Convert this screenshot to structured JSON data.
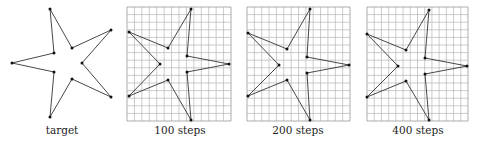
{
  "figure": {
    "panels": [
      {
        "label": "target",
        "has_grid": false,
        "caption_center_x": 62,
        "points": [
          [
            50,
            9
          ],
          [
            54,
            53
          ],
          [
            12,
            63
          ],
          [
            54,
            72
          ],
          [
            50,
            117
          ],
          [
            72,
            79
          ],
          [
            111,
            97
          ],
          [
            82,
            63
          ],
          [
            111,
            30
          ],
          [
            72,
            48
          ]
        ]
      },
      {
        "label": "100 steps",
        "has_grid": true,
        "grid": {
          "x0": 127,
          "y0": 7,
          "x1": 231,
          "y1": 121,
          "cols": 14,
          "rows": 15
        },
        "caption_center_x": 180,
        "points": [
          [
            191,
            9
          ],
          [
            187,
            56
          ],
          [
            229,
            64
          ],
          [
            187,
            72
          ],
          [
            191,
            120
          ],
          [
            168,
            80
          ],
          [
            129,
            96
          ],
          [
            160,
            64
          ],
          [
            129,
            32
          ],
          [
            168,
            48
          ]
        ]
      },
      {
        "label": "200 steps",
        "has_grid": true,
        "grid": {
          "x0": 247,
          "y0": 7,
          "x1": 350,
          "y1": 121,
          "cols": 14,
          "rows": 15
        },
        "caption_center_x": 298,
        "points": [
          [
            310,
            9
          ],
          [
            307,
            57
          ],
          [
            349,
            65
          ],
          [
            307,
            73
          ],
          [
            310,
            120
          ],
          [
            287,
            80
          ],
          [
            248,
            96
          ],
          [
            279,
            65
          ],
          [
            248,
            33
          ],
          [
            287,
            49
          ]
        ]
      },
      {
        "label": "400 steps",
        "has_grid": true,
        "grid": {
          "x0": 367,
          "y0": 7,
          "x1": 468,
          "y1": 121,
          "cols": 14,
          "rows": 15
        },
        "caption_center_x": 418,
        "points": [
          [
            429,
            10
          ],
          [
            425,
            58
          ],
          [
            467,
            66
          ],
          [
            425,
            74
          ],
          [
            429,
            120
          ],
          [
            406,
            81
          ],
          [
            367,
            97
          ],
          [
            398,
            66
          ],
          [
            367,
            34
          ],
          [
            406,
            50
          ]
        ]
      }
    ],
    "colors": {
      "outline": "#333333",
      "vertex": "#111111",
      "grid": "#b5b5b5",
      "grid_border": "#8a8a8a",
      "text": "#222222"
    }
  }
}
